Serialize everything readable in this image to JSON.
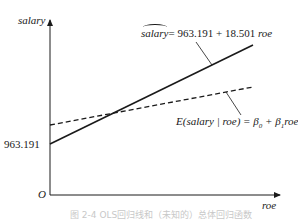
{
  "figure": {
    "y_axis_label": "salary",
    "x_axis_label": "roe",
    "origin_label": "O",
    "intercept_label": "963.191",
    "fitted_equation": {
      "lhs": "salary",
      "rhs": "= 963.191 + 18.501 ",
      "rhs_var": "roe"
    },
    "population_equation": {
      "text_prefix": "E(salary | roe) = β",
      "sub0": "0",
      "plus": " + β",
      "sub1": "1",
      "var": "roe"
    },
    "caption": "图 2-4 OLS回归线和（未知的）总体回归函数"
  },
  "lines": [
    {
      "name": "fitted-regression-line",
      "style": "solid",
      "intercept": 963.191,
      "slope": 18.501
    },
    {
      "name": "population-regression-function",
      "style": "dashed",
      "intercept": "beta0",
      "slope": "beta1"
    }
  ]
}
